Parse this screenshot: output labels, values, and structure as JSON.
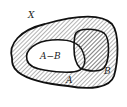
{
  "diagram": {
    "type": "venn-set-difference",
    "labels": {
      "universe": "X",
      "difference": "A−B",
      "set_a": "A",
      "set_b": "B"
    },
    "colors": {
      "stroke": "#111111",
      "hatch": "#555555",
      "background": "#ffffff",
      "unshaded_region": "#ffffff"
    },
    "shading": "diagonal-hatch"
  }
}
